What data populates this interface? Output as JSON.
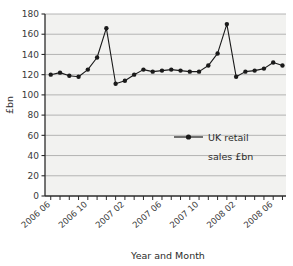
{
  "chart_data": {
    "type": "line",
    "title": "",
    "xlabel": "Year and Month",
    "ylabel": "£bn",
    "ylim": [
      0,
      180
    ],
    "ytick_step": 20,
    "yticks": [
      "0",
      "20",
      "40",
      "60",
      "80",
      "100",
      "120",
      "140",
      "160",
      "180"
    ],
    "grid": true,
    "legend_position": "inside-right",
    "legend": [
      "UK retail sales £bn"
    ],
    "legend_line1": "UK retail",
    "legend_line2": "sales £bn",
    "series_name": "UK retail sales £bn",
    "series_color": "#1a1a1a",
    "marker": "circle",
    "x": [
      "2006 06",
      "2006 07",
      "2006 08",
      "2006 09",
      "2006 10",
      "2006 11",
      "2006 12",
      "2007 01",
      "2007 02",
      "2007 03",
      "2007 04",
      "2007 05",
      "2007 06",
      "2007 07",
      "2007 08",
      "2007 09",
      "2007 10",
      "2007 11",
      "2007 12",
      "2008 01",
      "2008 02",
      "2008 03",
      "2008 04",
      "2008 05",
      "2008 06",
      "2008 07"
    ],
    "xtick_labels": [
      "2006 06",
      "2006 10",
      "2007 02",
      "2007 06",
      "2007 10",
      "2008 02",
      "2008 06"
    ],
    "xtick_indices": [
      0,
      4,
      8,
      12,
      16,
      20,
      24
    ],
    "values": [
      120,
      122,
      119,
      118,
      125,
      137,
      166,
      111,
      114,
      120,
      125,
      123,
      124,
      125,
      124,
      123,
      123,
      129,
      141,
      170,
      118,
      123,
      124,
      126,
      132,
      129
    ],
    "n_points": 26
  },
  "axis": {
    "ylabel": "£bn",
    "xlabel": "Year and Month"
  },
  "colors": {
    "plot_background": "#f2f2f0",
    "gridline": "#9a9a9a",
    "axis": "#2b2b2b",
    "series": "#1a1a1a",
    "page_background": "#ffffff"
  }
}
